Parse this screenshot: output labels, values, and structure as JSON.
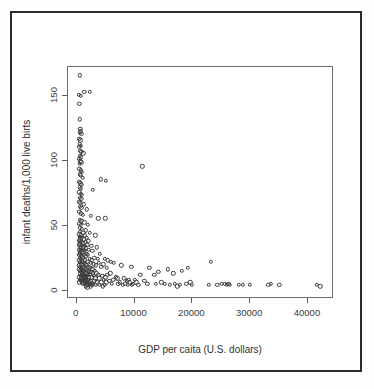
{
  "figure": {
    "background_color": "#ffffff",
    "frame_color": "#2b2b2b",
    "panel_border_color": "#6d6d6d",
    "point_color": "#3c3c3c"
  },
  "chart_data": {
    "type": "scatter",
    "title": "",
    "xlabel": "GDP per caita (U.S. dollars)",
    "ylabel": "infant deaths/1,000 live birts",
    "xlim": [
      -1500,
      44500
    ],
    "ylim": [
      -6,
      172
    ],
    "xticks": [
      0,
      10000,
      20000,
      30000,
      40000
    ],
    "xticklabels": [
      "0",
      "10000",
      "20000",
      "30000",
      "40000"
    ],
    "yticks": [
      0,
      50,
      100,
      150
    ],
    "yticklabels": [
      "0",
      "50",
      "100",
      "150"
    ],
    "grid": false,
    "legend": null,
    "marker": "open-circle",
    "points": [
      [
        700,
        165
      ],
      [
        500,
        150
      ],
      [
        900,
        149
      ],
      [
        1500,
        152
      ],
      [
        2400,
        152
      ],
      [
        600,
        143
      ],
      [
        700,
        131
      ],
      [
        800,
        124
      ],
      [
        900,
        122
      ],
      [
        700,
        121
      ],
      [
        1000,
        120
      ],
      [
        600,
        116
      ],
      [
        800,
        115
      ],
      [
        700,
        112
      ],
      [
        900,
        111
      ],
      [
        600,
        110
      ],
      [
        800,
        107
      ],
      [
        1000,
        106
      ],
      [
        1300,
        105
      ],
      [
        700,
        103
      ],
      [
        900,
        102
      ],
      [
        600,
        101
      ],
      [
        11500,
        95
      ],
      [
        800,
        99
      ],
      [
        1000,
        98
      ],
      [
        700,
        97
      ],
      [
        600,
        93
      ],
      [
        900,
        92
      ],
      [
        1100,
        91
      ],
      [
        700,
        89
      ],
      [
        850,
        88
      ],
      [
        1200,
        86
      ],
      [
        4300,
        85
      ],
      [
        5200,
        84
      ],
      [
        600,
        83
      ],
      [
        800,
        82
      ],
      [
        1000,
        81
      ],
      [
        700,
        79
      ],
      [
        900,
        78
      ],
      [
        3000,
        77
      ],
      [
        650,
        75
      ],
      [
        850,
        74
      ],
      [
        1100,
        73
      ],
      [
        700,
        71
      ],
      [
        950,
        70
      ],
      [
        600,
        68
      ],
      [
        800,
        67
      ],
      [
        1400,
        66
      ],
      [
        700,
        64
      ],
      [
        1000,
        63
      ],
      [
        1900,
        62
      ],
      [
        650,
        60
      ],
      [
        900,
        59
      ],
      [
        1200,
        58
      ],
      [
        2600,
        57
      ],
      [
        3900,
        55
      ],
      [
        5100,
        55
      ],
      [
        700,
        54
      ],
      [
        1000,
        53
      ],
      [
        1500,
        52
      ],
      [
        600,
        51
      ],
      [
        850,
        50
      ],
      [
        2100,
        50
      ],
      [
        700,
        48
      ],
      [
        1100,
        47
      ],
      [
        1700,
        46
      ],
      [
        750,
        45
      ],
      [
        1300,
        44
      ],
      [
        2400,
        44
      ],
      [
        650,
        43
      ],
      [
        900,
        42
      ],
      [
        1600,
        42
      ],
      [
        3400,
        42
      ],
      [
        700,
        41
      ],
      [
        1100,
        40
      ],
      [
        1900,
        40
      ],
      [
        800,
        39
      ],
      [
        1400,
        39
      ],
      [
        2200,
        38
      ],
      [
        600,
        38
      ],
      [
        1000,
        37
      ],
      [
        1700,
        37
      ],
      [
        750,
        36
      ],
      [
        1250,
        36
      ],
      [
        2000,
        35
      ],
      [
        650,
        35
      ],
      [
        1100,
        34
      ],
      [
        1550,
        34
      ],
      [
        2700,
        34
      ],
      [
        700,
        33
      ],
      [
        1350,
        33
      ],
      [
        1800,
        32
      ],
      [
        3700,
        33
      ],
      [
        850,
        32
      ],
      [
        1450,
        31
      ],
      [
        2300,
        31
      ],
      [
        600,
        31
      ],
      [
        1000,
        30
      ],
      [
        1600,
        30
      ],
      [
        2900,
        30
      ],
      [
        700,
        29
      ],
      [
        1200,
        29
      ],
      [
        1900,
        28
      ],
      [
        4200,
        28
      ],
      [
        800,
        28
      ],
      [
        1400,
        27
      ],
      [
        2100,
        27
      ],
      [
        650,
        27
      ],
      [
        1050,
        26
      ],
      [
        1750,
        26
      ],
      [
        3200,
        25
      ],
      [
        750,
        25
      ],
      [
        1300,
        25
      ],
      [
        2400,
        24
      ],
      [
        5000,
        24
      ],
      [
        900,
        24
      ],
      [
        1600,
        23
      ],
      [
        2800,
        23
      ],
      [
        5600,
        23
      ],
      [
        600,
        23
      ],
      [
        1150,
        22
      ],
      [
        2000,
        22
      ],
      [
        6100,
        22
      ],
      [
        700,
        22
      ],
      [
        1400,
        21
      ],
      [
        2600,
        21
      ],
      [
        6600,
        21
      ],
      [
        850,
        21
      ],
      [
        1700,
        20
      ],
      [
        3100,
        20
      ],
      [
        7900,
        19
      ],
      [
        1000,
        20
      ],
      [
        1900,
        19
      ],
      [
        3500,
        19
      ],
      [
        9600,
        18
      ],
      [
        650,
        19
      ],
      [
        1250,
        18
      ],
      [
        2200,
        18
      ],
      [
        4400,
        18
      ],
      [
        750,
        18
      ],
      [
        1500,
        17
      ],
      [
        2500,
        17
      ],
      [
        5400,
        17
      ],
      [
        900,
        17
      ],
      [
        1750,
        16
      ],
      [
        2900,
        16
      ],
      [
        12700,
        17
      ],
      [
        1100,
        16
      ],
      [
        2000,
        15
      ],
      [
        3300,
        15
      ],
      [
        15900,
        16
      ],
      [
        600,
        16
      ],
      [
        1350,
        15
      ],
      [
        2300,
        14
      ],
      [
        19400,
        17
      ],
      [
        800,
        15
      ],
      [
        1600,
        14
      ],
      [
        2700,
        14
      ],
      [
        18300,
        15
      ],
      [
        950,
        14
      ],
      [
        1850,
        13
      ],
      [
        3000,
        13
      ],
      [
        14300,
        14
      ],
      [
        1200,
        13
      ],
      [
        2100,
        12
      ],
      [
        3600,
        13
      ],
      [
        16900,
        13
      ],
      [
        700,
        13
      ],
      [
        1450,
        12
      ],
      [
        2450,
        12
      ],
      [
        11200,
        12
      ],
      [
        1050,
        12
      ],
      [
        1700,
        11
      ],
      [
        3900,
        12
      ],
      [
        13600,
        12
      ],
      [
        850,
        11
      ],
      [
        1950,
        11
      ],
      [
        4600,
        11
      ],
      [
        23400,
        22
      ],
      [
        1300,
        11
      ],
      [
        2250,
        10
      ],
      [
        5100,
        10
      ],
      [
        650,
        10
      ],
      [
        1550,
        10
      ],
      [
        2800,
        10
      ],
      [
        6900,
        10
      ],
      [
        1000,
        9
      ],
      [
        1800,
        9
      ],
      [
        3400,
        9
      ],
      [
        8300,
        9
      ],
      [
        1400,
        9
      ],
      [
        2150,
        8
      ],
      [
        4100,
        9
      ],
      [
        9100,
        8
      ],
      [
        750,
        8
      ],
      [
        1650,
        8
      ],
      [
        4900,
        8
      ],
      [
        10200,
        8
      ],
      [
        1150,
        8
      ],
      [
        2500,
        7
      ],
      [
        5800,
        7
      ],
      [
        11900,
        7
      ],
      [
        900,
        7
      ],
      [
        1900,
        7
      ],
      [
        3200,
        7
      ],
      [
        8800,
        7
      ],
      [
        1500,
        7
      ],
      [
        2300,
        6
      ],
      [
        4400,
        6
      ],
      [
        9400,
        6
      ],
      [
        600,
        6
      ],
      [
        1750,
        6
      ],
      [
        3700,
        6
      ],
      [
        10500,
        6
      ],
      [
        1100,
        6
      ],
      [
        2050,
        5
      ],
      [
        5300,
        6
      ],
      [
        8600,
        5
      ],
      [
        1350,
        5
      ],
      [
        2700,
        5
      ],
      [
        6300,
        5
      ],
      [
        9900,
        5
      ],
      [
        1650,
        5
      ],
      [
        3000,
        5
      ],
      [
        7400,
        5
      ],
      [
        12400,
        5
      ],
      [
        2000,
        4
      ],
      [
        3500,
        4
      ],
      [
        8100,
        4
      ],
      [
        13900,
        5
      ],
      [
        2400,
        4
      ],
      [
        4200,
        4
      ],
      [
        9000,
        4
      ],
      [
        15400,
        5
      ],
      [
        2900,
        4
      ],
      [
        5000,
        4
      ],
      [
        9700,
        4
      ],
      [
        17100,
        5
      ],
      [
        1800,
        3
      ],
      [
        4700,
        3
      ],
      [
        10800,
        4
      ],
      [
        18000,
        4
      ],
      [
        16300,
        4
      ],
      [
        17600,
        3
      ],
      [
        19100,
        5
      ],
      [
        19800,
        6
      ],
      [
        20100,
        4
      ],
      [
        23000,
        4
      ],
      [
        24500,
        4
      ],
      [
        25300,
        5
      ],
      [
        25800,
        5
      ],
      [
        26100,
        4
      ],
      [
        26400,
        5
      ],
      [
        26700,
        4
      ],
      [
        28200,
        4
      ],
      [
        28900,
        4
      ],
      [
        30100,
        4
      ],
      [
        33300,
        4
      ],
      [
        33700,
        5
      ],
      [
        35200,
        4
      ],
      [
        41700,
        4
      ],
      [
        42300,
        3
      ],
      [
        2000,
        2
      ],
      [
        6500,
        8
      ],
      [
        7200,
        9
      ],
      [
        4000,
        21
      ],
      [
        4800,
        20
      ],
      [
        3800,
        24
      ],
      [
        6000,
        13
      ],
      [
        5500,
        12
      ],
      [
        2600,
        3
      ],
      [
        3100,
        11
      ],
      [
        7600,
        6
      ],
      [
        14800,
        6
      ]
    ]
  }
}
